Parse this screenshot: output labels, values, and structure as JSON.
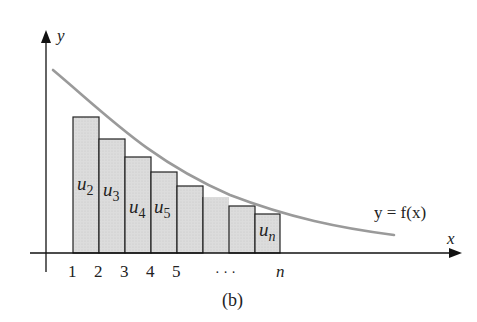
{
  "figure": {
    "caption": "(b)",
    "axes": {
      "x_label": "x",
      "y_label": "y"
    },
    "curve_label": "y = f(x)",
    "tick_labels": [
      "1",
      "2",
      "3",
      "4",
      "5",
      "· · ·",
      "n"
    ],
    "bars": [
      {
        "label": "u",
        "sub": "2"
      },
      {
        "label": "u",
        "sub": "3"
      },
      {
        "label": "u",
        "sub": "4"
      },
      {
        "label": "u",
        "sub": "5"
      },
      {
        "label": "",
        "sub": ""
      },
      {
        "label": "",
        "sub": ""
      },
      {
        "label": "",
        "sub": ""
      },
      {
        "label": "u",
        "sub": "n"
      }
    ],
    "colors": {
      "bar_fill": "#d9d9d9",
      "bar_stroke": "#222222",
      "curve": "#9a9a9a",
      "axis": "#111111"
    }
  }
}
